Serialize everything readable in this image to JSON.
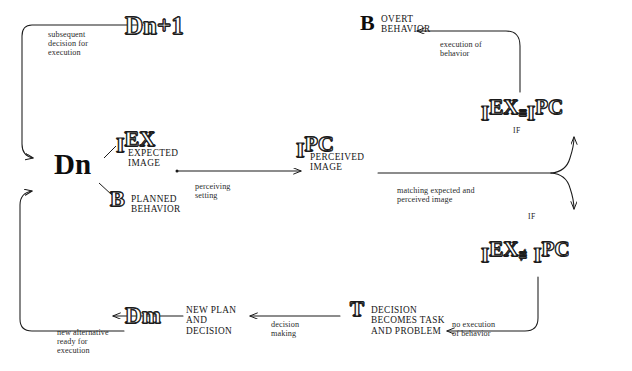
{
  "diagram": {
    "nodes": {
      "d_next": {
        "base": "D",
        "sub": "n+1",
        "name": "decision-n-plus-1"
      },
      "d_current": {
        "base": "D",
        "sub": "n",
        "name": "decision-n"
      },
      "d_alt": {
        "base": "D",
        "sub": "m",
        "name": "decision-m"
      },
      "i_expected": {
        "base": "I",
        "sup": "EX",
        "label": "EXPECTED\nIMAGE"
      },
      "b_planned": {
        "base": "B",
        "label": "PLANNED\nBEHAVIOR"
      },
      "i_perceived": {
        "base": "I",
        "sup": "PC",
        "label": "PERCEIVED\nIMAGE"
      },
      "b_overt": {
        "base": "B",
        "label": "OVERT\nBEHAVIOR"
      },
      "t_decision": {
        "base": "T",
        "label": "DECISION\nBECOMES TASK\nAND PROBLEM"
      },
      "new_plan": {
        "label": "NEW PLAN\nAND\nDECISION"
      }
    },
    "comparisons": {
      "match": {
        "left_base": "I",
        "left_sup": "EX",
        "operator": "≡",
        "right_base": "I",
        "right_sup": "PC",
        "condition": "IF"
      },
      "mismatch": {
        "left_base": "I",
        "left_sup": "EX",
        "operator": "≢",
        "right_base": "I",
        "right_sup": "PC",
        "condition": "IF"
      }
    },
    "annotations": {
      "subsequent_decision": "subsequent\ndecision for\nexecution",
      "execution_of_behavior": "execution of\nbehavior",
      "perceiving_setting": "perceiving\nsetting",
      "matching": "matching expected and\nperceived image",
      "no_execution": "no execution\nof behavior",
      "decision_making": "decision\nmaking",
      "new_alternative": "new alternative\nready for\nexecution"
    },
    "colors": {
      "ink": "#1b1b1b",
      "paper": "#ffffff",
      "annotation": "#2b2b2b"
    }
  }
}
